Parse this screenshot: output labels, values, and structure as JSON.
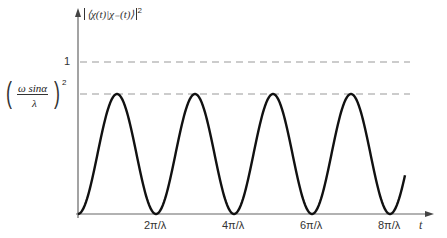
{
  "chart_data": {
    "type": "line",
    "title": "",
    "ylabel": "|⟨χ(t)|χ_(t)⟩|²",
    "xlabel": "t",
    "x_ticks": [
      "2π/λ",
      "4π/λ",
      "6π/λ",
      "8π/λ"
    ],
    "y_ticks": [
      "1",
      "(ω sinα / λ)²"
    ],
    "reference_lines": [
      {
        "y": 1,
        "style": "dashed",
        "label": "1"
      },
      {
        "y": "(ω sinα/λ)²",
        "style": "dashed",
        "label": "amplitude"
      }
    ],
    "series": [
      {
        "name": "transition probability",
        "function": "(ω sinα/λ)² · sin²(λt/2)",
        "x_range": [
          0,
          "≈8.4π/λ"
        ],
        "peaks_at": [
          "π/λ",
          "3π/λ",
          "5π/λ",
          "7π/λ"
        ]
      }
    ],
    "grid": false
  },
  "labels": {
    "ylabel_text": "⟨χ(t)|χ₋(t)⟩",
    "ylabel_exp": "2",
    "y_one": "1",
    "amp_num": "ω sinα",
    "amp_den": "λ",
    "amp_exp": "2",
    "x_axis": "t",
    "ticks": [
      "2π/λ",
      "4π/λ",
      "6π/λ",
      "8π/λ"
    ]
  }
}
